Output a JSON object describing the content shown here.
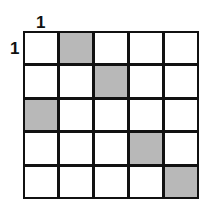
{
  "labels": {
    "column_start": "1",
    "row_start": "1"
  },
  "grid": {
    "rows": 5,
    "cols": 5,
    "shaded_color": "#b8b8b8",
    "cells": [
      [
        0,
        1,
        0,
        0,
        0
      ],
      [
        0,
        0,
        1,
        0,
        0
      ],
      [
        1,
        0,
        0,
        0,
        0
      ],
      [
        0,
        0,
        0,
        1,
        0
      ],
      [
        0,
        0,
        0,
        0,
        1
      ]
    ]
  }
}
